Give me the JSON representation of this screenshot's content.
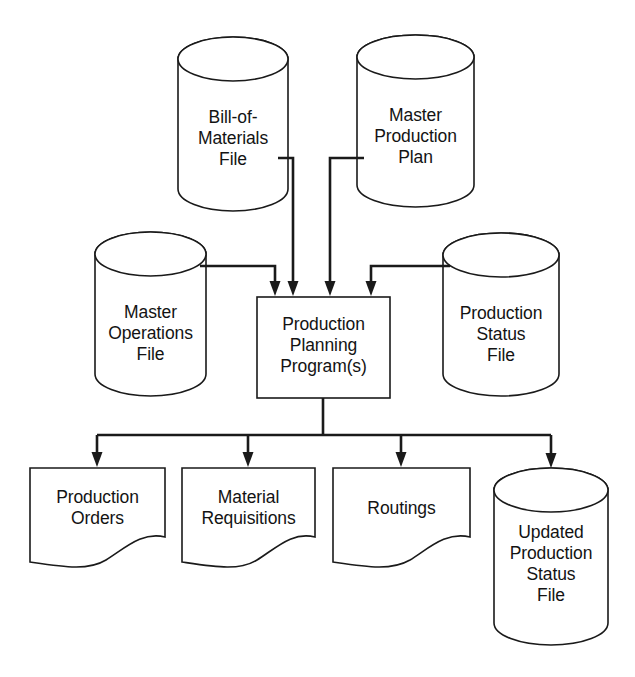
{
  "diagram": {
    "background_color": "#ffffff",
    "stroke_color": "#1a1a1a",
    "text_color": "#131313",
    "nodes": [
      {
        "id": "bill-of-materials-file",
        "type": "cylinder",
        "label": "Bill-of-\nMaterials\nFile",
        "x": 178,
        "y": 37,
        "w": 110,
        "h": 174
      },
      {
        "id": "master-production-plan",
        "type": "cylinder",
        "label": "Master\nProduction\nPlan",
        "x": 357,
        "y": 35,
        "w": 117,
        "h": 172
      },
      {
        "id": "master-operations-file",
        "type": "cylinder",
        "label": "Master\nOperations\nFile",
        "x": 95,
        "y": 232,
        "w": 111,
        "h": 164
      },
      {
        "id": "production-status-file",
        "type": "cylinder",
        "label": "Production\nStatus\nFile",
        "x": 443,
        "y": 233,
        "w": 116,
        "h": 163
      },
      {
        "id": "production-planning-program",
        "type": "process-box",
        "label": "Production\nPlanning\nProgram(s)",
        "x": 257,
        "y": 297,
        "w": 133,
        "h": 101
      },
      {
        "id": "production-orders",
        "type": "document",
        "label": "Production\nOrders",
        "x": 30,
        "y": 468,
        "w": 135,
        "h": 94
      },
      {
        "id": "material-requisitions",
        "type": "document",
        "label": "Material\nRequisitions",
        "x": 182,
        "y": 468,
        "w": 133,
        "h": 94
      },
      {
        "id": "routings",
        "type": "document",
        "label": "Routings",
        "x": 333,
        "y": 468,
        "w": 137,
        "h": 94
      },
      {
        "id": "updated-production-status-file",
        "type": "cylinder",
        "label": "Updated\nProduction\nStatus\nFile",
        "x": 494,
        "y": 468,
        "w": 114,
        "h": 177
      }
    ],
    "edges": [
      {
        "id": "edge-bom-to-program",
        "from": "bill-of-materials-file",
        "to": "production-planning-program",
        "arrow": true
      },
      {
        "id": "edge-mpp-to-program",
        "from": "master-production-plan",
        "to": "production-planning-program",
        "arrow": true
      },
      {
        "id": "edge-mof-to-program",
        "from": "master-operations-file",
        "to": "production-planning-program",
        "arrow": true
      },
      {
        "id": "edge-psf-to-program",
        "from": "production-status-file",
        "to": "production-planning-program",
        "arrow": true
      },
      {
        "id": "edge-program-to-production-orders",
        "from": "production-planning-program",
        "to": "production-orders",
        "arrow": true
      },
      {
        "id": "edge-program-to-material-requisitions",
        "from": "production-planning-program",
        "to": "material-requisitions",
        "arrow": true
      },
      {
        "id": "edge-program-to-routings",
        "from": "production-planning-program",
        "to": "routings",
        "arrow": true
      },
      {
        "id": "edge-program-to-updated-status",
        "from": "production-planning-program",
        "to": "updated-production-status-file",
        "arrow": true
      }
    ]
  }
}
